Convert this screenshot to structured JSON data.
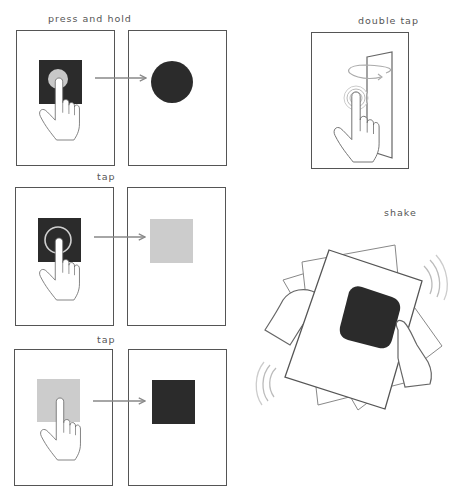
{
  "gestures": [
    {
      "id": "press-and-hold",
      "label": "press and hold",
      "before": {
        "target_shape": "square",
        "target_color": "#2b2b2b",
        "touch_indicator": "filled-circle",
        "touch_color": "#c8c8c8"
      },
      "after": {
        "result_shape": "circle",
        "result_color": "#2b2b2b"
      }
    },
    {
      "id": "double-tap",
      "label": "double tap",
      "content": {
        "object": "flipping-card",
        "touch_indicator": "concentric-rings",
        "rotation_indicator": "circular-arrow"
      }
    },
    {
      "id": "tap-1",
      "label": "tap",
      "before": {
        "target_shape": "square",
        "target_color": "#2b2b2b",
        "touch_indicator": "ring",
        "touch_color": "#c8c8c8"
      },
      "after": {
        "result_shape": "square",
        "result_color": "#cccccc"
      }
    },
    {
      "id": "shake",
      "label": "shake",
      "content": {
        "object": "rounded-square",
        "object_color": "#2b2b2b",
        "hands": 2,
        "motion_lines": true
      }
    },
    {
      "id": "tap-2",
      "label": "tap",
      "before": {
        "target_shape": "square",
        "target_color": "#cccccc"
      },
      "after": {
        "result_shape": "square",
        "result_color": "#2b2b2b"
      }
    }
  ],
  "colors": {
    "stroke": "#555555",
    "dark": "#2b2b2b",
    "light": "#cccccc",
    "arrow": "#888888",
    "motion": "#bbbbbb"
  }
}
